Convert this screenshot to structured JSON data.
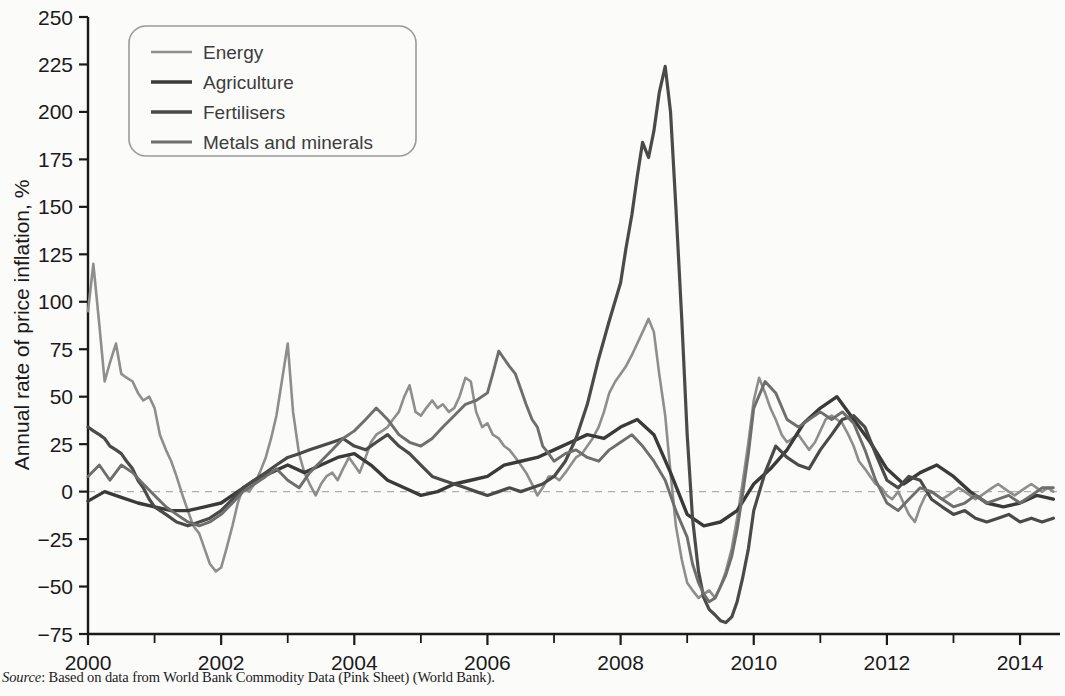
{
  "source_note": {
    "label": "Source",
    "text": ": Based on data from World Bank Commodity Data (Pink Sheet) (World Bank)."
  },
  "chart_data": {
    "type": "line",
    "title": "",
    "xlabel": "",
    "ylabel": "Annual rate of price inflation, %",
    "xlim": [
      2000,
      2014.6
    ],
    "ylim": [
      -75,
      250
    ],
    "grid": false,
    "zero_line": true,
    "legend_position": "top-left",
    "x_ticks": [
      2000,
      2002,
      2004,
      2006,
      2008,
      2010,
      2012,
      2014
    ],
    "x_tick_labels": [
      "2000",
      "2002",
      "2004",
      "2006",
      "2008",
      "2010",
      "2012",
      "2014"
    ],
    "x_minor_ticks": [
      2001,
      2003,
      2005,
      2007,
      2009,
      2011,
      2013
    ],
    "y_ticks": [
      -75,
      -50,
      -25,
      0,
      25,
      50,
      75,
      100,
      125,
      150,
      175,
      200,
      225,
      250
    ],
    "y_tick_labels": [
      "−75",
      "−50",
      "−25",
      "0",
      "25",
      "50",
      "75",
      "100",
      "125",
      "150",
      "175",
      "200",
      "225",
      "250"
    ],
    "colors": {
      "energy": "#8e8e8e",
      "agriculture": "#3a3a3a",
      "fertilisers": "#4a4a4a",
      "metals": "#6e6e6e",
      "zero_line": "#b0b0b0",
      "axis": "#1a1a1a"
    },
    "series": [
      {
        "name": "Energy",
        "color": "#8e8e8e",
        "x": [
          2000.0,
          2000.08,
          2000.17,
          2000.25,
          2000.33,
          2000.42,
          2000.5,
          2000.58,
          2000.67,
          2000.75,
          2000.83,
          2000.92,
          2001.0,
          2001.08,
          2001.17,
          2001.25,
          2001.33,
          2001.42,
          2001.5,
          2001.58,
          2001.67,
          2001.75,
          2001.83,
          2001.92,
          2002.0,
          2002.08,
          2002.17,
          2002.25,
          2002.33,
          2002.42,
          2002.5,
          2002.58,
          2002.67,
          2002.75,
          2002.83,
          2002.92,
          2003.0,
          2003.08,
          2003.17,
          2003.25,
          2003.33,
          2003.42,
          2003.5,
          2003.58,
          2003.67,
          2003.75,
          2003.83,
          2003.92,
          2004.0,
          2004.08,
          2004.17,
          2004.25,
          2004.33,
          2004.42,
          2004.5,
          2004.58,
          2004.67,
          2004.75,
          2004.83,
          2004.92,
          2005.0,
          2005.08,
          2005.17,
          2005.25,
          2005.33,
          2005.42,
          2005.5,
          2005.58,
          2005.67,
          2005.75,
          2005.83,
          2005.92,
          2006.0,
          2006.08,
          2006.17,
          2006.25,
          2006.33,
          2006.42,
          2006.5,
          2006.58,
          2006.67,
          2006.75,
          2006.83,
          2006.92,
          2007.0,
          2007.08,
          2007.17,
          2007.25,
          2007.33,
          2007.42,
          2007.5,
          2007.58,
          2007.67,
          2007.75,
          2007.83,
          2007.92,
          2008.0,
          2008.08,
          2008.17,
          2008.25,
          2008.33,
          2008.42,
          2008.5,
          2008.58,
          2008.67,
          2008.75,
          2008.83,
          2008.92,
          2009.0,
          2009.08,
          2009.17,
          2009.25,
          2009.33,
          2009.42,
          2009.5,
          2009.58,
          2009.67,
          2009.75,
          2009.83,
          2009.92,
          2010.0,
          2010.08,
          2010.17,
          2010.25,
          2010.33,
          2010.42,
          2010.5,
          2010.58,
          2010.67,
          2010.75,
          2010.83,
          2010.92,
          2011.0,
          2011.08,
          2011.17,
          2011.25,
          2011.33,
          2011.42,
          2011.5,
          2011.58,
          2011.67,
          2011.75,
          2011.83,
          2011.92,
          2012.0,
          2012.08,
          2012.17,
          2012.25,
          2012.33,
          2012.42,
          2012.5,
          2012.58,
          2012.67,
          2012.75,
          2012.83,
          2012.92,
          2013.0,
          2013.08,
          2013.17,
          2013.25,
          2013.33,
          2013.42,
          2013.5,
          2013.58,
          2013.67,
          2013.75,
          2013.83,
          2013.92,
          2014.0,
          2014.08,
          2014.17,
          2014.25,
          2014.33,
          2014.42,
          2014.5
        ],
        "values": [
          95,
          120,
          88,
          58,
          68,
          78,
          62,
          60,
          58,
          52,
          48,
          50,
          44,
          30,
          22,
          16,
          8,
          -2,
          -10,
          -18,
          -22,
          -30,
          -38,
          -42,
          -40,
          -30,
          -18,
          -6,
          2,
          0,
          4,
          10,
          18,
          28,
          40,
          60,
          78,
          42,
          20,
          10,
          4,
          -2,
          4,
          8,
          10,
          6,
          12,
          18,
          14,
          10,
          18,
          26,
          30,
          32,
          34,
          38,
          42,
          50,
          56,
          42,
          40,
          44,
          48,
          44,
          46,
          42,
          44,
          50,
          60,
          58,
          42,
          34,
          36,
          30,
          28,
          24,
          22,
          18,
          14,
          10,
          4,
          -2,
          2,
          8,
          8,
          6,
          10,
          14,
          18,
          20,
          24,
          28,
          34,
          42,
          52,
          58,
          62,
          66,
          72,
          78,
          84,
          91,
          84,
          62,
          40,
          10,
          -18,
          -36,
          -48,
          -52,
          -56,
          -54,
          -52,
          -56,
          -50,
          -42,
          -30,
          -14,
          4,
          26,
          48,
          60,
          52,
          44,
          38,
          30,
          26,
          28,
          30,
          26,
          22,
          26,
          32,
          38,
          40,
          38,
          36,
          30,
          24,
          16,
          12,
          8,
          4,
          2,
          -2,
          -4,
          0,
          -6,
          -12,
          -16,
          -8,
          -2,
          0,
          -2,
          -4,
          -2,
          0,
          2,
          0,
          -2,
          -4,
          -2,
          0,
          2,
          4,
          2,
          0,
          -2,
          0,
          2,
          4,
          2,
          0,
          2,
          0
        ]
      },
      {
        "name": "Agriculture",
        "color": "#3a3a3a",
        "x": [
          2000.0,
          2000.25,
          2000.5,
          2000.75,
          2001.0,
          2001.25,
          2001.5,
          2001.75,
          2002.0,
          2002.25,
          2002.5,
          2002.75,
          2003.0,
          2003.25,
          2003.5,
          2003.75,
          2004.0,
          2004.25,
          2004.5,
          2004.75,
          2005.0,
          2005.25,
          2005.5,
          2005.75,
          2006.0,
          2006.25,
          2006.5,
          2006.75,
          2007.0,
          2007.25,
          2007.5,
          2007.75,
          2008.0,
          2008.25,
          2008.5,
          2008.75,
          2009.0,
          2009.25,
          2009.5,
          2009.75,
          2010.0,
          2010.25,
          2010.5,
          2010.75,
          2011.0,
          2011.25,
          2011.5,
          2011.75,
          2012.0,
          2012.25,
          2012.5,
          2012.75,
          2013.0,
          2013.25,
          2013.5,
          2013.75,
          2014.0,
          2014.25,
          2014.5
        ],
        "values": [
          -5,
          0,
          -3,
          -6,
          -8,
          -10,
          -10,
          -8,
          -6,
          0,
          6,
          10,
          14,
          10,
          14,
          18,
          20,
          14,
          6,
          2,
          -2,
          0,
          4,
          6,
          8,
          14,
          16,
          18,
          22,
          26,
          30,
          28,
          34,
          38,
          30,
          10,
          -12,
          -18,
          -16,
          -10,
          4,
          12,
          22,
          36,
          44,
          50,
          38,
          26,
          12,
          4,
          10,
          14,
          8,
          0,
          -6,
          -8,
          -6,
          -2,
          -4
        ]
      },
      {
        "name": "Fertilisers",
        "color": "#4a4a4a",
        "x": [
          2000.0,
          2000.08,
          2000.17,
          2000.25,
          2000.33,
          2000.42,
          2000.5,
          2000.58,
          2000.67,
          2000.75,
          2000.83,
          2000.92,
          2001.0,
          2001.17,
          2001.33,
          2001.5,
          2001.67,
          2001.83,
          2002.0,
          2002.17,
          2002.33,
          2002.5,
          2002.67,
          2002.83,
          2003.0,
          2003.17,
          2003.33,
          2003.5,
          2003.67,
          2003.83,
          2004.0,
          2004.17,
          2004.33,
          2004.5,
          2004.67,
          2004.83,
          2005.0,
          2005.17,
          2005.33,
          2005.5,
          2005.67,
          2005.83,
          2006.0,
          2006.17,
          2006.33,
          2006.5,
          2006.67,
          2006.83,
          2007.0,
          2007.17,
          2007.33,
          2007.5,
          2007.67,
          2007.83,
          2008.0,
          2008.08,
          2008.17,
          2008.25,
          2008.33,
          2008.42,
          2008.5,
          2008.58,
          2008.67,
          2008.75,
          2008.83,
          2008.92,
          2009.0,
          2009.08,
          2009.17,
          2009.25,
          2009.33,
          2009.42,
          2009.5,
          2009.58,
          2009.67,
          2009.75,
          2009.83,
          2009.92,
          2010.0,
          2010.17,
          2010.33,
          2010.5,
          2010.67,
          2010.83,
          2011.0,
          2011.17,
          2011.33,
          2011.5,
          2011.67,
          2011.83,
          2012.0,
          2012.17,
          2012.33,
          2012.5,
          2012.67,
          2012.83,
          2013.0,
          2013.17,
          2013.33,
          2013.5,
          2013.67,
          2013.83,
          2014.0,
          2014.17,
          2014.33,
          2014.5
        ],
        "values": [
          34,
          32,
          30,
          28,
          24,
          22,
          20,
          16,
          12,
          6,
          2,
          -4,
          -8,
          -12,
          -16,
          -18,
          -16,
          -14,
          -10,
          -4,
          2,
          6,
          10,
          14,
          18,
          20,
          22,
          24,
          26,
          28,
          24,
          22,
          26,
          30,
          24,
          20,
          14,
          8,
          6,
          4,
          2,
          0,
          -2,
          0,
          2,
          0,
          2,
          4,
          8,
          16,
          28,
          46,
          70,
          90,
          110,
          128,
          146,
          166,
          184,
          176,
          190,
          210,
          224,
          200,
          150,
          90,
          30,
          -14,
          -42,
          -56,
          -62,
          -65,
          -68,
          -69,
          -66,
          -58,
          -46,
          -30,
          -10,
          10,
          24,
          18,
          14,
          12,
          22,
          30,
          38,
          40,
          34,
          20,
          6,
          2,
          8,
          6,
          -4,
          -8,
          -12,
          -10,
          -14,
          -16,
          -14,
          -12,
          -16,
          -14,
          -16,
          -14
        ]
      },
      {
        "name": "Metals and minerals",
        "color": "#6e6e6e",
        "x": [
          2000.0,
          2000.17,
          2000.33,
          2000.5,
          2000.67,
          2000.83,
          2001.0,
          2001.17,
          2001.33,
          2001.5,
          2001.67,
          2001.83,
          2002.0,
          2002.17,
          2002.33,
          2002.5,
          2002.67,
          2002.83,
          2003.0,
          2003.17,
          2003.33,
          2003.5,
          2003.67,
          2003.83,
          2004.0,
          2004.17,
          2004.33,
          2004.5,
          2004.67,
          2004.83,
          2005.0,
          2005.17,
          2005.33,
          2005.5,
          2005.67,
          2005.83,
          2006.0,
          2006.08,
          2006.17,
          2006.25,
          2006.33,
          2006.42,
          2006.5,
          2006.58,
          2006.67,
          2006.75,
          2006.83,
          2006.92,
          2007.0,
          2007.17,
          2007.33,
          2007.5,
          2007.67,
          2007.83,
          2008.0,
          2008.17,
          2008.33,
          2008.5,
          2008.67,
          2008.83,
          2009.0,
          2009.08,
          2009.17,
          2009.25,
          2009.33,
          2009.42,
          2009.5,
          2009.58,
          2009.67,
          2009.75,
          2009.83,
          2009.92,
          2010.0,
          2010.17,
          2010.33,
          2010.5,
          2010.67,
          2010.83,
          2011.0,
          2011.17,
          2011.33,
          2011.5,
          2011.67,
          2011.83,
          2012.0,
          2012.17,
          2012.33,
          2012.5,
          2012.67,
          2012.83,
          2013.0,
          2013.17,
          2013.33,
          2013.5,
          2013.67,
          2013.83,
          2014.0,
          2014.17,
          2014.33,
          2014.5
        ],
        "values": [
          8,
          14,
          6,
          14,
          10,
          4,
          -2,
          -8,
          -12,
          -16,
          -18,
          -16,
          -12,
          -6,
          0,
          4,
          8,
          12,
          6,
          2,
          10,
          16,
          22,
          28,
          32,
          38,
          44,
          38,
          30,
          26,
          24,
          28,
          34,
          40,
          46,
          48,
          52,
          62,
          74,
          70,
          66,
          62,
          54,
          46,
          38,
          34,
          24,
          20,
          16,
          20,
          22,
          18,
          16,
          22,
          26,
          30,
          24,
          16,
          6,
          -10,
          -24,
          -38,
          -48,
          -54,
          -58,
          -56,
          -50,
          -44,
          -34,
          -20,
          -2,
          20,
          44,
          58,
          52,
          38,
          34,
          38,
          42,
          38,
          42,
          36,
          22,
          6,
          -6,
          -10,
          -4,
          2,
          0,
          -4,
          -8,
          -6,
          -2,
          -6,
          -4,
          -2,
          -6,
          -2,
          2,
          2
        ]
      }
    ]
  },
  "legend": {
    "items": [
      {
        "label": "Energy",
        "color": "#8e8e8e",
        "width": 2.6
      },
      {
        "label": "Agriculture",
        "color": "#3a3a3a",
        "width": 3.6
      },
      {
        "label": "Fertilisers",
        "color": "#4a4a4a",
        "width": 3.4
      },
      {
        "label": "Metals and minerals",
        "color": "#6e6e6e",
        "width": 3.0
      }
    ]
  }
}
